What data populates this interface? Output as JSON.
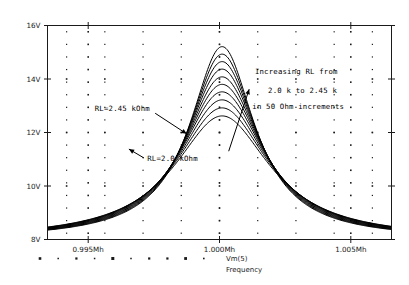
{
  "chart_data": {
    "type": "line",
    "title": "",
    "xlabel": "Frequency",
    "ylabel": "",
    "xlim": [
      0.99345,
      1.00655
    ],
    "ylim": [
      8,
      16
    ],
    "xticks": [
      0.995,
      1.0,
      1.005
    ],
    "xtick_labels": [
      "0.995Mh",
      "1.000Mh",
      "1.005Mh"
    ],
    "yticks": [
      8,
      10,
      12,
      14,
      16
    ],
    "ytick_labels": [
      "8V",
      "10V",
      "12V",
      "14V",
      "16V"
    ],
    "grid": "dotted",
    "legend_position": "bottom",
    "legend": [
      "Vm(5)"
    ],
    "series_param_name": "RL",
    "series_param_unit": "kOhm",
    "series": [
      {
        "name": "RL=2.00 kOhm",
        "rl": 2.0,
        "peak_v": 12.62,
        "peak_f": 1.0001,
        "bw": 0.00445
      },
      {
        "name": "RL=2.05 kOhm",
        "rl": 2.05,
        "peak_v": 12.92,
        "peak_f": 1.0001,
        "bw": 0.00425
      },
      {
        "name": "RL=2.10 kOhm",
        "rl": 2.1,
        "peak_v": 13.22,
        "peak_f": 1.0001,
        "bw": 0.00406
      },
      {
        "name": "RL=2.15 kOhm",
        "rl": 2.15,
        "peak_v": 13.52,
        "peak_f": 1.0001,
        "bw": 0.00388
      },
      {
        "name": "RL=2.20 kOhm",
        "rl": 2.2,
        "peak_v": 13.8,
        "peak_f": 1.0001,
        "bw": 0.00371
      },
      {
        "name": "RL=2.25 kOhm",
        "rl": 2.25,
        "peak_v": 14.08,
        "peak_f": 1.0001,
        "bw": 0.00355
      },
      {
        "name": "RL=2.30 kOhm",
        "rl": 2.3,
        "peak_v": 14.37,
        "peak_f": 1.0001,
        "bw": 0.0034
      },
      {
        "name": "RL=2.35 kOhm",
        "rl": 2.35,
        "peak_v": 14.65,
        "peak_f": 1.0001,
        "bw": 0.00326
      },
      {
        "name": "RL=2.40 kOhm",
        "rl": 2.4,
        "peak_v": 14.93,
        "peak_f": 1.0001,
        "bw": 0.00313
      },
      {
        "name": "RL=2.45 kOhm",
        "rl": 2.45,
        "peak_v": 15.21,
        "peak_f": 1.0001,
        "bw": 0.00301
      }
    ],
    "annotations": [
      {
        "id": "rl-max-label",
        "text": "RL=2.45 kOhm",
        "x": 0.99525,
        "y": 12.82,
        "arrow_to_x": 0.99795,
        "arrow_to_y": 12.05
      },
      {
        "id": "rl-min-label",
        "text": "RL=2.0 kOhm",
        "x": 0.99725,
        "y": 10.92,
        "arrow_to_x": 0.99625,
        "arrow_to_y": 11.25
      },
      {
        "id": "increasing-line-1",
        "text": "Increasing RL from",
        "x": 1.00135,
        "y": 14.18
      },
      {
        "id": "increasing-line-2",
        "text": "2.0 k to 2.45 k",
        "x": 1.00185,
        "y": 13.48
      },
      {
        "id": "increasing-line-3",
        "text": "in 50 Ohm increments",
        "x": 1.00125,
        "y": 12.86
      },
      {
        "id": "increasing-arrow",
        "text": "",
        "x": 1.00105,
        "y": 13.52,
        "arrow_to_x": 1.00105,
        "arrow_to_y": 13.52
      }
    ]
  },
  "colors": {
    "curve": "#000000",
    "axis": "#1a1a1a",
    "grid": "#1a1a1a",
    "background": "#ffffff"
  },
  "legend": {
    "trace_label": "Vm(5)",
    "axis_title": "Frequency"
  }
}
